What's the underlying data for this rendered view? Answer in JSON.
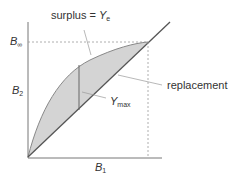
{
  "diagram": {
    "type": "surplus-production",
    "axes": {
      "x": {
        "label_main": "B",
        "label_sub": "1"
      },
      "y": {
        "label_main": "B",
        "label_sub": "2"
      }
    },
    "levels": {
      "b_inf": {
        "label_main": "B",
        "label_sub": "∞"
      }
    },
    "annotations": {
      "surplus": {
        "text": "surplus = ",
        "var_main": "Y",
        "var_sub": "e"
      },
      "replacement": {
        "text": "replacement"
      },
      "ymax": {
        "var_main": "Y",
        "var_sub": "max"
      }
    },
    "colors": {
      "fill": "#d4d4d4",
      "line": "#555555",
      "curve": "#888888",
      "dash": "#999999",
      "axis": "#777777"
    }
  }
}
